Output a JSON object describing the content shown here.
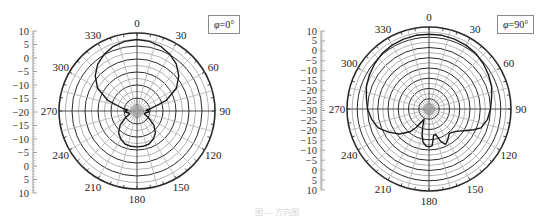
{
  "chart_data": [
    {
      "type": "polar",
      "title": "",
      "legend": "φ=0°",
      "radial_axis": {
        "label_ticks": [
          "10",
          "5",
          "0",
          "−5",
          "−10",
          "−15",
          "−20",
          "−15",
          "−10",
          "−5",
          "0",
          "5",
          "10"
        ],
        "min": -20,
        "max": 10,
        "step": 5,
        "unit": "dB"
      },
      "angular_ticks": [
        "0",
        "30",
        "60",
        "90",
        "120",
        "150",
        "180",
        "210",
        "240",
        "270",
        "300",
        "330"
      ],
      "series": [
        {
          "name": "φ=0°",
          "theta_deg": [
            0,
            10,
            20,
            30,
            40,
            50,
            60,
            70,
            80,
            85,
            90,
            95,
            100,
            110,
            120,
            130,
            140,
            150,
            160,
            170,
            180,
            190,
            200,
            210,
            220,
            230,
            240,
            250,
            260,
            265,
            270,
            275,
            280,
            290,
            300,
            310,
            320,
            330,
            340,
            350,
            360
          ],
          "r_db": [
            7.5,
            7.2,
            6.5,
            5.2,
            3.5,
            1.0,
            -2.5,
            -8,
            -14.5,
            -16.5,
            -15.5,
            -15.5,
            -16.5,
            -17,
            -15,
            -11.5,
            -9,
            -7.5,
            -6.5,
            -6.2,
            -6.2,
            -6.2,
            -6.5,
            -7.5,
            -9,
            -11.5,
            -15,
            -17,
            -16.5,
            -15.5,
            -15.5,
            -16.5,
            -14.5,
            -8,
            -2.5,
            1.0,
            3.5,
            5.2,
            6.5,
            7.2,
            7.5
          ]
        }
      ]
    },
    {
      "type": "polar",
      "title": "",
      "legend": "φ=90°",
      "radial_axis": {
        "label_ticks": [
          "10",
          "5",
          "0",
          "−5",
          "−10",
          "−15",
          "−20",
          "−25",
          "−30",
          "−25",
          "−20",
          "−15",
          "−10",
          "−5",
          "0",
          "5",
          "10"
        ],
        "min": -30,
        "max": 10,
        "step": 5,
        "unit": "dB"
      },
      "angular_ticks": [
        "0",
        "30",
        "60",
        "90",
        "120",
        "150",
        "180",
        "210",
        "240",
        "270",
        "300",
        "330"
      ],
      "series": [
        {
          "name": "φ=90°",
          "theta_deg": [
            0,
            10,
            20,
            30,
            40,
            50,
            60,
            70,
            80,
            90,
            100,
            110,
            115,
            120,
            130,
            140,
            150,
            155,
            160,
            165,
            170,
            175,
            180,
            185,
            190,
            195,
            200,
            205,
            210,
            215,
            220,
            230,
            240,
            245,
            250,
            260,
            270,
            280,
            290,
            300,
            310,
            320,
            330,
            340,
            350,
            360
          ],
          "r_db": [
            6.5,
            6.5,
            6.3,
            6.0,
            5.5,
            4.5,
            3.5,
            2.5,
            1.0,
            0.0,
            -1.0,
            -3.0,
            -6.0,
            -9.0,
            -13.0,
            -14.5,
            -12.0,
            -11.0,
            -13.0,
            -17.0,
            -17.0,
            -12.0,
            -11.5,
            -12.0,
            -13.5,
            -17.0,
            -21.0,
            -24.5,
            -23.0,
            -19.0,
            -15.5,
            -11.0,
            -7.5,
            -5.5,
            -3.5,
            -1.5,
            0.0,
            1.0,
            2.5,
            3.5,
            4.5,
            5.5,
            6.0,
            6.3,
            6.5,
            6.5
          ]
        }
      ]
    }
  ],
  "panels": [
    {
      "legend_var": "φ",
      "legend_val": "=0°"
    },
    {
      "legend_var": "φ",
      "legend_val": "=90°"
    }
  ],
  "caption": "图 — 方向图"
}
